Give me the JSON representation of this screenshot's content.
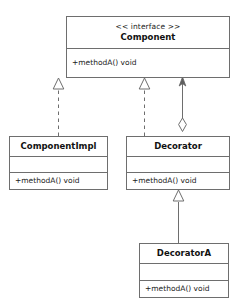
{
  "diagram": {
    "background_color": "#ffffff",
    "line_color": "#6e6e6e",
    "text_color": "#1a1a1a",
    "classes": [
      {
        "id": "component",
        "stereotype": "<< interface >>",
        "name": "Component",
        "attributes": [],
        "methods": [
          "+methodA() void"
        ],
        "has_empty_attribute_compartment": false
      },
      {
        "id": "componentimpl",
        "stereotype": "",
        "name": "ComponentImpl",
        "attributes": [],
        "methods": [
          "+methodA() void"
        ],
        "has_empty_attribute_compartment": true
      },
      {
        "id": "decorator",
        "stereotype": "",
        "name": "Decorator",
        "attributes": [],
        "methods": [
          "+methodA() void"
        ],
        "has_empty_attribute_compartment": true
      },
      {
        "id": "decoratora",
        "stereotype": "",
        "name": "DecoratorA",
        "attributes": [],
        "methods": [
          "+methodA() void"
        ],
        "has_empty_attribute_compartment": true
      }
    ],
    "relationships": [
      {
        "id": "componentimpl-realizes-component",
        "type": "realization",
        "line_style": "dashed",
        "arrow_head": "hollow-triangle",
        "from": "ComponentImpl",
        "to": "Component",
        "label": ""
      },
      {
        "id": "decorator-realizes-component",
        "type": "realization",
        "line_style": "dashed",
        "arrow_head": "hollow-triangle",
        "from": "Decorator",
        "to": "Component",
        "label": ""
      },
      {
        "id": "decorator-aggregates-component",
        "type": "aggregation",
        "line_style": "solid",
        "arrow_head": "open-arrow",
        "tail_head": "hollow-diamond",
        "from": "Decorator",
        "to": "Component",
        "label": ""
      },
      {
        "id": "decoratora-extends-decorator",
        "type": "generalization",
        "line_style": "solid",
        "arrow_head": "hollow-triangle",
        "from": "DecoratorA",
        "to": "Decorator",
        "label": ""
      }
    ]
  }
}
